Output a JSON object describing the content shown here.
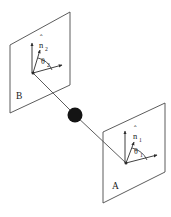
{
  "figure": {
    "background_color": "#ffffff",
    "line_color": "#4a4a4a",
    "label_color": "#1a1a1a",
    "source_color": "#141414",
    "width": 171,
    "height": 217
  },
  "source": {
    "name": "source-particle",
    "cx": 75,
    "cy": 115,
    "r": 7.5
  },
  "planes": [
    {
      "id": "plane-b",
      "label": "B",
      "label_x": 16,
      "label_y": 99,
      "corners": "10,45 70,12 70,85 10,113",
      "vertex_x": 33,
      "vertex_y": 73
    },
    {
      "id": "plane-a",
      "label": "A",
      "label_x": 112,
      "label_y": 189,
      "corners": "103,132 165,103 165,172 103,203",
      "vertex_x": 126,
      "vertex_y": 163
    }
  ],
  "vectors": {
    "plane_b": {
      "normal_symbol": "n",
      "normal_hat": "ˆ",
      "normal_subscript": "2",
      "normal_label_x": 40,
      "normal_label_y": 46,
      "angle_symbol": "θ",
      "angle_subscript": "2",
      "angle_label_x": 42,
      "angle_label_y": 64,
      "up_arrow": "32,73 32,43",
      "tilt_arrow": "33,73 40,50",
      "side_arrow": "33,73 62,65"
    },
    "plane_a": {
      "normal_symbol": "n",
      "normal_hat": "ˆ",
      "normal_subscript": "1",
      "normal_label_x": 134,
      "normal_label_y": 137,
      "angle_symbol": "θ",
      "angle_subscript": "1",
      "angle_label_x": 135,
      "angle_label_y": 154,
      "up_arrow": "125,163 125,131",
      "tilt_arrow": "126,163 134,142",
      "side_arrow": "126,163 157,155"
    }
  },
  "rays": [
    {
      "id": "ray-b",
      "path": "33,73 75,115"
    },
    {
      "id": "ray-a",
      "path": "75,115 126,163"
    }
  ]
}
